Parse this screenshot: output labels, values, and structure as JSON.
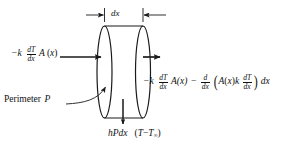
{
  "figure": {
    "background_color": "#ffffff",
    "line_color": "#1a1a1a"
  },
  "labels": {
    "dx": {
      "name": "dx-dimension-label",
      "text": "dx"
    },
    "left_flux": {
      "name": "left-conduction-label",
      "text": "-k (dT/dx) A (x)",
      "parts": {
        "minus_k": "−k",
        "frac_num": "dT",
        "frac_den": "dx",
        "area": "A",
        "open": "(",
        "var": "x",
        "close": ")"
      }
    },
    "right_flux": {
      "name": "right-conduction-label",
      "text": "-k (dT/dx) A(x) - (d/dx)(A(x) k dT/dx) dx",
      "parts": {
        "minus_k": "−k",
        "frac1_num": "dT",
        "frac1_den": "dx",
        "area1": "A(x)",
        "minus": "−",
        "frac2_num": "d",
        "frac2_den": "dx",
        "open_paren": "(",
        "area2": "A",
        "open2": "(",
        "var2": "x",
        "close2": ")",
        "k": "k",
        "frac3_num": "dT",
        "frac3_den": "dx",
        "close_paren": ")",
        "dx": "dx"
      }
    },
    "perimeter": {
      "name": "perimeter-label",
      "text": "Perimeter P",
      "parts": {
        "word": "Perimeter",
        "symbol": "P"
      }
    },
    "convection": {
      "name": "convection-loss-label",
      "text": "hPdx (T - T∞)",
      "parts": {
        "hPdx": "hPdx",
        "open": "(",
        "T": "T",
        "minus": "−",
        "T2": "T",
        "inf": "∞",
        "close": ")"
      }
    }
  },
  "geometry": {
    "cylinder": {
      "left_x": 104,
      "right_x": 143,
      "top_y": 26,
      "bottom_y": 118,
      "ellipse_rx": 7.5
    },
    "arrows": {
      "left_inflow": {
        "from_x": 60,
        "to_x": 103,
        "y": 57
      },
      "right_outflow": {
        "from_x": 143,
        "to_x": 162,
        "y": 57
      },
      "convection_down": {
        "x": 123,
        "from_y": 99,
        "to_y": 126
      },
      "perimeter_pointer": {
        "from_x": 73,
        "from_y": 101,
        "to_x": 105,
        "to_y": 88
      }
    },
    "dimension_line_y": 15
  }
}
